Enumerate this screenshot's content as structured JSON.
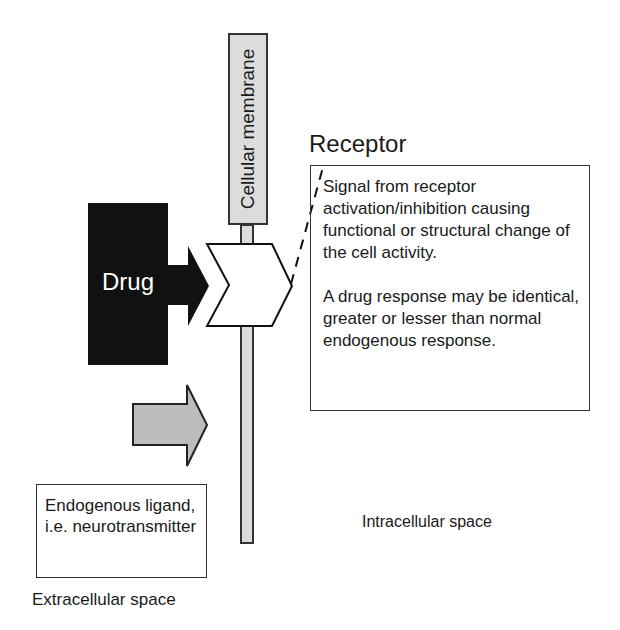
{
  "diagram": {
    "membrane": {
      "label": "Cellular membrane",
      "fill": "#dcdcdc"
    },
    "drug": {
      "label": "Drug",
      "fill": "#111111"
    },
    "receptor": {
      "title": "Receptor",
      "description": [
        "Signal from receptor activation/inhibition causing functional or structural change of the cell activity.",
        "A drug response may be identical, greater or lesser than normal endogenous response."
      ]
    },
    "endogenous_ligand": {
      "label": "Endogenous ligand, i.e. neurotransmitter",
      "arrow_fill": "#bdbdbd"
    },
    "regions": {
      "extracellular": "Extracellular space",
      "intracellular": "Intracellular space"
    }
  }
}
